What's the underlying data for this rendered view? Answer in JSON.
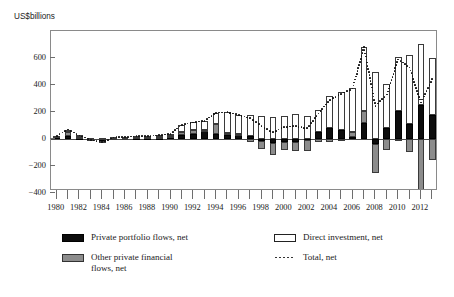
{
  "page": {
    "clipped_header_text": "",
    "y_axis_unit_label": "US$billions"
  },
  "legend": {
    "items": [
      {
        "key": "private-portfolio",
        "label": "Private portfolio flows, net",
        "style": "black",
        "color": "#0d0d0d"
      },
      {
        "key": "direct-investment",
        "label": "Direct investment, net",
        "style": "white",
        "color": "#ffffff"
      },
      {
        "key": "other-private",
        "label": "Other private financial\nflows, net",
        "style": "gray",
        "color": "#8c8c8c"
      },
      {
        "key": "total-net",
        "label": "Total, net",
        "style": "dotted",
        "color": "#333333"
      }
    ]
  },
  "chart_data": {
    "type": "bar",
    "stacked": true,
    "title": "",
    "subtitle": "",
    "xlabel": "",
    "ylabel": "US$billions",
    "ylim": [
      -500,
      760
    ],
    "yticks": [
      600,
      400,
      200,
      0,
      -200,
      -400
    ],
    "ytick_labels": [
      "600",
      "400",
      "200",
      "0",
      "−200",
      "−400"
    ],
    "grid": false,
    "legend_position": "below",
    "x": [
      1980,
      1981,
      1982,
      1983,
      1984,
      1985,
      1986,
      1987,
      1988,
      1989,
      1990,
      1991,
      1992,
      1993,
      1994,
      1995,
      1996,
      1997,
      1998,
      1999,
      2000,
      2001,
      2002,
      2003,
      2004,
      2005,
      2006,
      2007,
      2008,
      2009,
      2010,
      2011,
      2012,
      2013
    ],
    "xtick_labels": [
      "1980",
      "1982",
      "1984",
      "1986",
      "1988",
      "1990",
      "1992",
      "1994",
      "1996",
      "1998",
      "2000",
      "2002",
      "2004",
      "2006",
      "2008",
      "2010",
      "2012"
    ],
    "xtick_years": [
      1980,
      1982,
      1984,
      1986,
      1988,
      1990,
      1992,
      1994,
      1996,
      1998,
      2000,
      2002,
      2004,
      2006,
      2008,
      2010,
      2012
    ],
    "series": [
      {
        "name": "Private portfolio flows, net",
        "style": "black",
        "values": [
          14,
          20,
          10,
          -3,
          -18,
          5,
          6,
          8,
          8,
          10,
          12,
          30,
          40,
          60,
          35,
          30,
          32,
          20,
          -15,
          -30,
          -25,
          -20,
          -10,
          50,
          85,
          65,
          15,
          120,
          -35,
          85,
          210,
          110,
          255,
          180
        ]
      },
      {
        "name": "Other private financial flows, net",
        "style": "gray",
        "values": [
          8,
          32,
          8,
          -8,
          -10,
          2,
          3,
          5,
          5,
          6,
          10,
          20,
          28,
          10,
          75,
          18,
          2,
          -22,
          -60,
          -85,
          -55,
          -70,
          -80,
          -25,
          -25,
          -15,
          35,
          85,
          -215,
          -80,
          -15,
          -95,
          -435,
          -155
        ]
      },
      {
        "name": "Direct investment, net",
        "style": "white",
        "values": [
          2,
          18,
          8,
          5,
          5,
          5,
          6,
          8,
          10,
          12,
          15,
          55,
          55,
          65,
          85,
          150,
          145,
          155,
          170,
          165,
          170,
          185,
          170,
          165,
          230,
          285,
          325,
          475,
          495,
          325,
          395,
          515,
          450,
          420
        ]
      }
    ],
    "total_line": {
      "name": "Total, net",
      "style": "dotted",
      "values": [
        24,
        70,
        26,
        -6,
        -23,
        12,
        15,
        21,
        23,
        28,
        37,
        105,
        123,
        135,
        195,
        198,
        179,
        153,
        95,
        50,
        90,
        95,
        80,
        190,
        290,
        335,
        375,
        680,
        245,
        330,
        590,
        530,
        270,
        445
      ]
    }
  }
}
